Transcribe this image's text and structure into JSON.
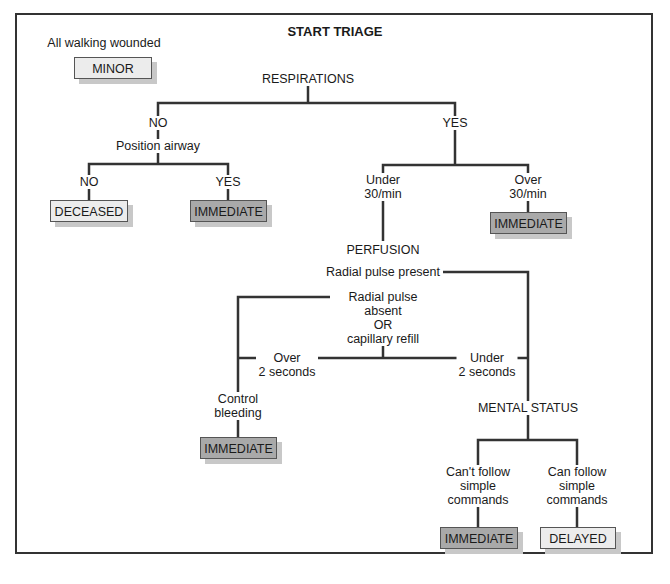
{
  "title": "START TRIAGE",
  "walking": {
    "label": "All walking wounded",
    "category": "MINOR"
  },
  "respirations": {
    "label": "RESPIRATIONS",
    "no": {
      "label": "NO",
      "action": "Position airway",
      "no_label": "NO",
      "no_result": "DECEASED",
      "yes_label": "YES",
      "yes_result": "IMMEDIATE"
    },
    "yes": {
      "label": "YES",
      "under": {
        "line1": "Under",
        "line2": "30/min"
      },
      "over": {
        "line1": "Over",
        "line2": "30/min",
        "result": "IMMEDIATE"
      }
    }
  },
  "perfusion": {
    "label": "PERFUSION",
    "present": "Radial pulse present",
    "absent": {
      "line1": "Radial pulse",
      "line2": "absent",
      "line3": "OR",
      "line4": "capillary refill"
    },
    "over": {
      "line1": "Over",
      "line2": "2 seconds"
    },
    "under": {
      "line1": "Under",
      "line2": "2 seconds"
    },
    "control": {
      "line1": "Control",
      "line2": "bleeding",
      "result": "IMMEDIATE"
    }
  },
  "mental_status": {
    "label": "MENTAL STATUS",
    "cant": {
      "line1": "Can't follow",
      "line2": "simple",
      "line3": "commands",
      "result": "IMMEDIATE"
    },
    "can": {
      "line1": "Can follow",
      "line2": "simple",
      "line3": "commands",
      "result": "DELAYED"
    }
  },
  "colors": {
    "immediate": "#a9a9a9",
    "minor_deceased_delayed": "#ececec",
    "line": "#333333"
  }
}
